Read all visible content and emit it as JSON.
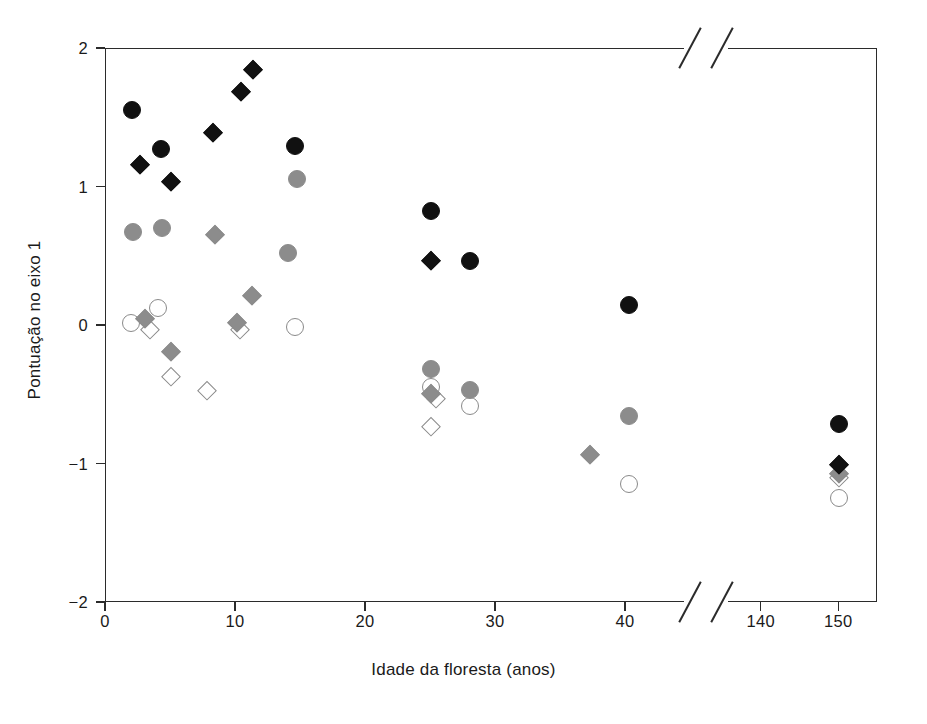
{
  "chart_data": {
    "type": "scatter",
    "title": "",
    "xlabel": "Idade da floresta (anos)",
    "ylabel": "Pontuação no eixo 1",
    "xlim": [
      0,
      155
    ],
    "ylim": [
      -2,
      2
    ],
    "grid": false,
    "legend_position": "none",
    "axis_break": {
      "axis": "x",
      "from": 45,
      "to": 135
    },
    "xticks": [
      0,
      10,
      20,
      30,
      40,
      140,
      150
    ],
    "xtick_labels": [
      "0",
      "10",
      "20",
      "30",
      "40",
      "140",
      "150"
    ],
    "yticks": [
      -2,
      -1,
      0,
      1,
      2
    ],
    "ytick_labels": [
      "−2",
      "−1",
      "0",
      "1",
      "2"
    ],
    "marker_styles": {
      "black-circle": {
        "shape": "circle",
        "fill": "#111111",
        "edge": "#111111",
        "size": 18
      },
      "black-diamond": {
        "shape": "diamond",
        "fill": "#111111",
        "edge": "#111111",
        "size": 18
      },
      "gray-circle": {
        "shape": "circle",
        "fill": "#8c8c8c",
        "edge": "#8c8c8c",
        "size": 18
      },
      "gray-diamond": {
        "shape": "diamond",
        "fill": "#8c8c8c",
        "edge": "#8c8c8c",
        "size": 18
      },
      "open-circle": {
        "shape": "circle",
        "fill": "#ffffff",
        "edge": "#8a8a8a",
        "size": 18
      },
      "open-diamond": {
        "shape": "diamond",
        "fill": "#ffffff",
        "edge": "#8a8a8a",
        "size": 18
      }
    },
    "series": [
      {
        "name": "black-circle",
        "points": [
          {
            "x": 2.0,
            "y": 1.56
          },
          {
            "x": 4.2,
            "y": 1.28
          },
          {
            "x": 14.5,
            "y": 1.3
          },
          {
            "x": 25.0,
            "y": 0.83
          },
          {
            "x": 28.0,
            "y": 0.47
          },
          {
            "x": 40.2,
            "y": 0.15
          },
          {
            "x": 150.0,
            "y": -0.71
          }
        ]
      },
      {
        "name": "black-diamond",
        "points": [
          {
            "x": 2.6,
            "y": 1.16
          },
          {
            "x": 5.0,
            "y": 1.04
          },
          {
            "x": 8.2,
            "y": 1.39
          },
          {
            "x": 10.4,
            "y": 1.69
          },
          {
            "x": 11.3,
            "y": 1.85
          },
          {
            "x": 25.0,
            "y": 0.47
          },
          {
            "x": 150.0,
            "y": -1.0
          }
        ]
      },
      {
        "name": "gray-circle",
        "points": [
          {
            "x": 2.1,
            "y": 0.68
          },
          {
            "x": 4.3,
            "y": 0.71
          },
          {
            "x": 14.0,
            "y": 0.53
          },
          {
            "x": 14.7,
            "y": 1.06
          },
          {
            "x": 25.0,
            "y": -0.31
          },
          {
            "x": 28.0,
            "y": -0.46
          },
          {
            "x": 40.2,
            "y": -0.65
          }
        ]
      },
      {
        "name": "gray-diamond",
        "points": [
          {
            "x": 3.0,
            "y": 0.05
          },
          {
            "x": 5.0,
            "y": -0.19
          },
          {
            "x": 8.4,
            "y": 0.66
          },
          {
            "x": 10.1,
            "y": 0.02
          },
          {
            "x": 11.2,
            "y": 0.22
          },
          {
            "x": 25.0,
            "y": -0.49
          },
          {
            "x": 37.2,
            "y": -0.93
          },
          {
            "x": 150.0,
            "y": -1.07
          }
        ]
      },
      {
        "name": "open-circle",
        "points": [
          {
            "x": 1.9,
            "y": 0.02
          },
          {
            "x": 4.0,
            "y": 0.13
          },
          {
            "x": 14.5,
            "y": -0.01
          },
          {
            "x": 25.0,
            "y": -0.44
          },
          {
            "x": 28.0,
            "y": -0.58
          },
          {
            "x": 40.2,
            "y": -1.14
          },
          {
            "x": 150.0,
            "y": -1.24
          }
        ]
      },
      {
        "name": "open-diamond",
        "points": [
          {
            "x": 3.4,
            "y": -0.03
          },
          {
            "x": 5.0,
            "y": -0.37
          },
          {
            "x": 7.8,
            "y": -0.47
          },
          {
            "x": 10.3,
            "y": -0.03
          },
          {
            "x": 25.4,
            "y": -0.53
          },
          {
            "x": 25.0,
            "y": -0.73
          },
          {
            "x": 150.0,
            "y": -1.1
          }
        ]
      }
    ]
  }
}
